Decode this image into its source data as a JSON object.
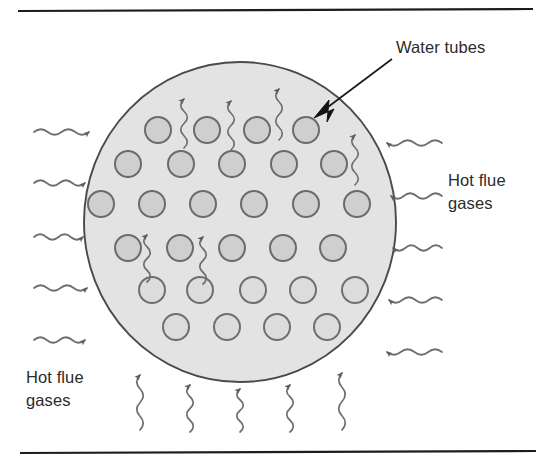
{
  "figure": {
    "type": "technical-diagram",
    "width": 546,
    "height": 466,
    "background_color": "#ffffff"
  },
  "labels": {
    "water_tubes": "Water tubes",
    "hot_flue_gases_right": "Hot flue gases",
    "hot_flue_gases_right_line1": "Hot flue",
    "hot_flue_gases_right_line2": "gases",
    "hot_flue_gases_bottom_left": "Hot flue gases",
    "hot_flue_gases_bottom_left_line1": "Hot flue",
    "hot_flue_gases_bottom_left_line2": "gases"
  },
  "colors": {
    "vessel_fill": "#e3e3e3",
    "vessel_stroke": "#4a4a4a",
    "tube_fill": "#cfcfcf",
    "tube_stroke": "#6b6b6b",
    "squiggle_stroke": "#6e6e6e",
    "rule_stroke": "#1c1c1c",
    "label_text": "#2b2b2b",
    "leader_stroke": "#1a1a1a"
  },
  "rules": [
    {
      "name": "top-rule",
      "x1": 18,
      "y1": 11,
      "x2": 533,
      "y2": 9
    },
    {
      "name": "bottom-rule",
      "x1": 20,
      "y1": 453,
      "x2": 536,
      "y2": 451
    }
  ],
  "vessel": {
    "name": "boiler-shell",
    "cx": 240,
    "cy": 222,
    "rx": 156,
    "ry": 160
  },
  "tubes": {
    "count": 30,
    "radius": 13,
    "rows": [
      {
        "row": 1,
        "cy": 130,
        "cx": [
          158,
          207,
          257,
          306
        ]
      },
      {
        "row": 2,
        "cy": 164,
        "cx": [
          128,
          181,
          232,
          284,
          334
        ]
      },
      {
        "row": 3,
        "cy": 204,
        "cx": [
          101,
          152,
          203,
          254,
          306,
          357
        ]
      },
      {
        "row": 4,
        "cy": 248,
        "cx": [
          128,
          180,
          232,
          283,
          333
        ]
      },
      {
        "row": 5,
        "cy": 290,
        "cx": [
          152,
          200,
          253,
          303,
          355
        ]
      },
      {
        "row": 6,
        "cy": 327,
        "cx": [
          176,
          227,
          277,
          327
        ]
      }
    ]
  },
  "flow_arrows": {
    "left_inward": {
      "direction": "right",
      "label_ref": "hot_flue_gases_bottom_left",
      "items": [
        {
          "x_start": 34,
          "y": 132,
          "x_tip": 96
        },
        {
          "x_start": 34,
          "y": 183,
          "x_tip": 92
        },
        {
          "x_start": 34,
          "y": 237,
          "x_tip": 90
        },
        {
          "x_start": 34,
          "y": 288,
          "x_tip": 94
        },
        {
          "x_start": 34,
          "y": 340,
          "x_tip": 92
        }
      ]
    },
    "right_inward": {
      "direction": "left",
      "label_ref": "hot_flue_gases_right",
      "items": [
        {
          "x_start": 442,
          "y": 143,
          "x_tip": 380
        },
        {
          "x_start": 442,
          "y": 196,
          "x_tip": 384
        },
        {
          "x_start": 442,
          "y": 248,
          "x_tip": 386
        },
        {
          "x_start": 442,
          "y": 300,
          "x_tip": 382
        },
        {
          "x_start": 442,
          "y": 352,
          "x_tip": 380
        }
      ]
    },
    "bottom_upward": {
      "direction": "up",
      "items": [
        {
          "x": 140,
          "y_start": 430,
          "y_tip": 368
        },
        {
          "x": 190,
          "y_start": 432,
          "y_tip": 378
        },
        {
          "x": 240,
          "y_start": 432,
          "y_tip": 382
        },
        {
          "x": 290,
          "y_start": 432,
          "y_tip": 378
        },
        {
          "x": 342,
          "y_start": 430,
          "y_tip": 366
        }
      ]
    },
    "interior_upward": {
      "direction": "up",
      "items": [
        {
          "x": 184,
          "y_start": 148,
          "y_tip": 92
        },
        {
          "x": 231,
          "y_start": 150,
          "y_tip": 94
        },
        {
          "x": 279,
          "y_start": 140,
          "y_tip": 82
        },
        {
          "x": 355,
          "y_start": 185,
          "y_tip": 128
        },
        {
          "x": 147,
          "y_start": 282,
          "y_tip": 228
        },
        {
          "x": 203,
          "y_start": 284,
          "y_tip": 230
        }
      ]
    }
  },
  "callout": {
    "name": "water-tubes-callout",
    "line_from": {
      "x": 392,
      "y": 59
    },
    "line_to": {
      "x": 320,
      "y": 113
    },
    "arrow_tip": {
      "x": 314,
      "y": 118
    },
    "target_tube": {
      "row": 1,
      "index": 4
    }
  },
  "label_positions": {
    "water_tubes": {
      "x": 396,
      "y": 53
    },
    "hot_flue_right": {
      "x": 448,
      "y": 186
    },
    "hot_flue_bottom_left": {
      "x": 26,
      "y": 383
    }
  }
}
